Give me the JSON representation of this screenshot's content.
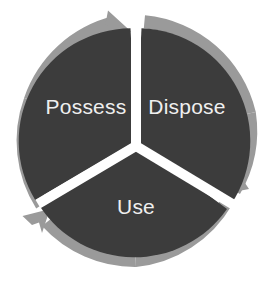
{
  "diagram": {
    "type": "cycle",
    "direction": "clockwise",
    "segment_count": 3,
    "colors": {
      "background": "#ffffff",
      "segment_fill": "#3c3c3c",
      "ring_arrow": "#9a9a9a",
      "divider": "#ffffff",
      "label_text": "#efefef"
    },
    "geometry": {
      "center_x": 136,
      "center_y": 141,
      "outer_radius": 126,
      "inner_radius": 113,
      "ring_thickness": 13,
      "divider_width": 10
    },
    "segments": [
      {
        "id": "possess",
        "label": "Possess",
        "position": "upper-left",
        "label_x": 86,
        "label_y": 108,
        "start_angle": 240,
        "end_angle": 360
      },
      {
        "id": "dispose",
        "label": "Dispose",
        "position": "upper-right",
        "label_x": 187,
        "label_y": 108,
        "start_angle": 0,
        "end_angle": 120
      },
      {
        "id": "use",
        "label": "Use",
        "position": "bottom",
        "label_x": 136,
        "label_y": 208,
        "start_angle": 120,
        "end_angle": 240
      }
    ],
    "arrows": [
      {
        "id": "arrow-top",
        "points_to": "dispose",
        "at_angle": 0
      },
      {
        "id": "arrow-lower-right",
        "points_to": "use",
        "at_angle": 120
      },
      {
        "id": "arrow-lower-left",
        "points_to": "possess",
        "at_angle": 240
      }
    ]
  }
}
